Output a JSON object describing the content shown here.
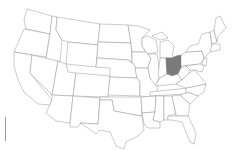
{
  "map": {
    "region": "United States",
    "highlighted_state": "Ohio",
    "colors": {
      "highlight": "#7a7a7a",
      "default_fill": "#ffffff",
      "border": "#8a8a8a"
    }
  }
}
